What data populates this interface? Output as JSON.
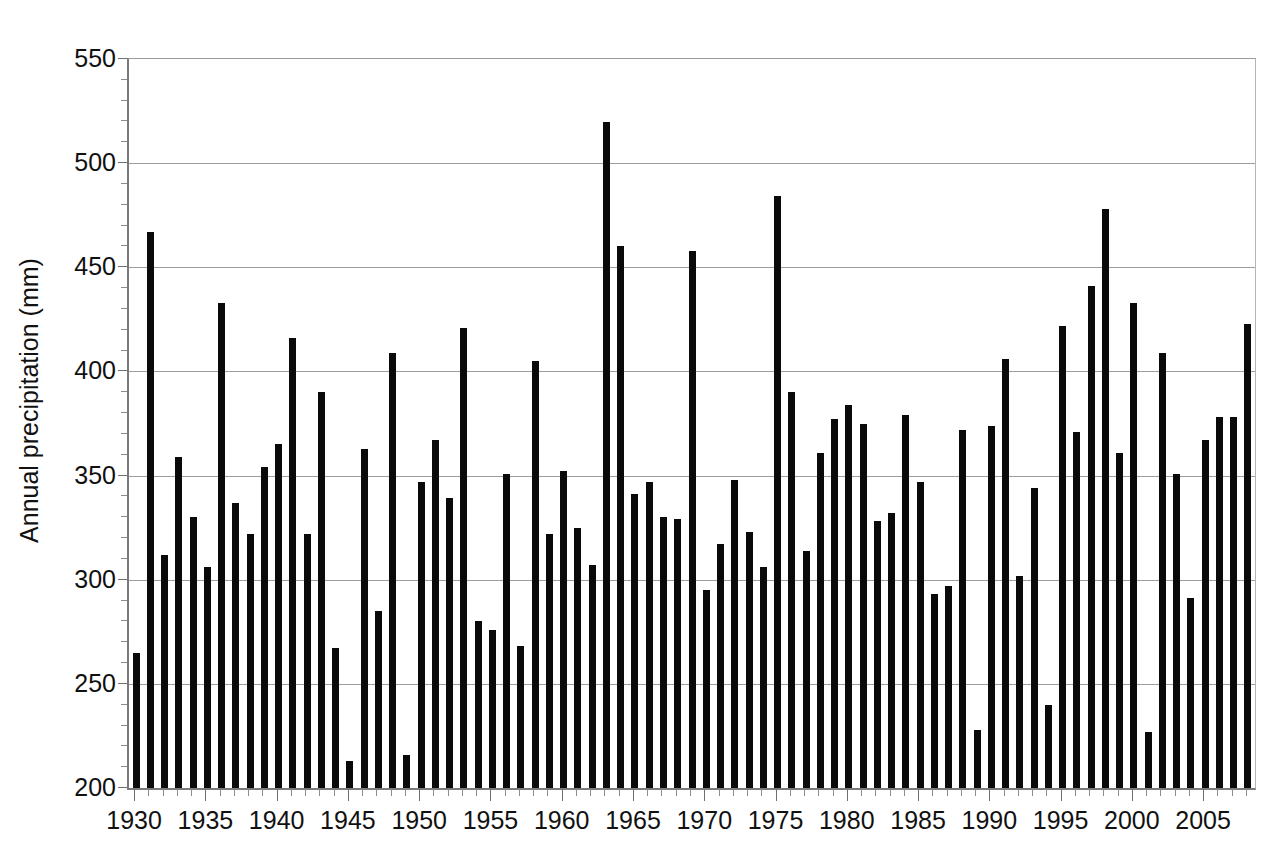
{
  "chart_data": {
    "type": "bar",
    "title": "",
    "xlabel": "",
    "ylabel": "Annual precipitation (mm)",
    "ylim": [
      200,
      550
    ],
    "ytick_step": 50,
    "yticks": [
      200,
      250,
      300,
      350,
      400,
      450,
      500,
      550
    ],
    "ytick_labels": [
      "200",
      "250",
      "300",
      "350",
      "400",
      "450",
      "500",
      "550"
    ],
    "y_minor_step": 10,
    "grid": "horizontal",
    "legend": "none",
    "xlim": [
      1929.5,
      2008.5
    ],
    "xtick_labels": [
      "1930",
      "1935",
      "1940",
      "1945",
      "1950",
      "1955",
      "1960",
      "1965",
      "1970",
      "1975",
      "1980",
      "1985",
      "1990",
      "1995",
      "2000",
      "2005"
    ],
    "xtick_values": [
      1930,
      1935,
      1940,
      1945,
      1950,
      1955,
      1960,
      1965,
      1970,
      1975,
      1980,
      1985,
      1990,
      1995,
      2000,
      2005
    ],
    "bar_color": "#0a0a0a",
    "categories": [
      1930,
      1931,
      1932,
      1933,
      1934,
      1935,
      1936,
      1937,
      1938,
      1939,
      1940,
      1941,
      1942,
      1943,
      1944,
      1945,
      1946,
      1947,
      1948,
      1949,
      1950,
      1951,
      1952,
      1953,
      1954,
      1955,
      1956,
      1957,
      1958,
      1959,
      1960,
      1961,
      1962,
      1963,
      1964,
      1965,
      1966,
      1967,
      1968,
      1969,
      1970,
      1971,
      1972,
      1973,
      1974,
      1975,
      1976,
      1977,
      1978,
      1979,
      1980,
      1981,
      1982,
      1983,
      1984,
      1985,
      1986,
      1987,
      1988,
      1989,
      1990,
      1991,
      1992,
      1993,
      1994,
      1995,
      1996,
      1997,
      1998,
      1999,
      2000,
      2001,
      2002,
      2003,
      2004,
      2005,
      2006,
      2007,
      2008
    ],
    "values": [
      265,
      467,
      312,
      359,
      330,
      306,
      433,
      337,
      322,
      354,
      365,
      416,
      322,
      390,
      267,
      213,
      363,
      285,
      409,
      216,
      347,
      367,
      339,
      421,
      280,
      276,
      351,
      268,
      405,
      322,
      352,
      325,
      307,
      520,
      460,
      341,
      347,
      330,
      329,
      458,
      295,
      317,
      348,
      323,
      306,
      484,
      390,
      314,
      361,
      377,
      384,
      375,
      328,
      332,
      379,
      347,
      293,
      297,
      372,
      228,
      374,
      406,
      302,
      344,
      240,
      422,
      371,
      441,
      478,
      361,
      433,
      227,
      409,
      351,
      291,
      367,
      378,
      378,
      423
    ]
  }
}
